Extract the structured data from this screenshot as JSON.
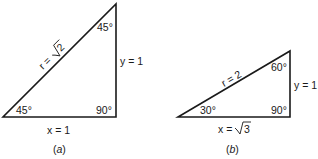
{
  "figures": [
    {
      "id": "a",
      "caption_open": "(",
      "caption_letter": "a",
      "caption_close": ")",
      "hypotenuse_label_prefix": "r = ",
      "hypotenuse_label_radicand": "2",
      "hypotenuse_value": "r = √2",
      "vertical_label": "y = 1",
      "horizontal_label": "x = 1",
      "angle_bottom_left": "45°",
      "angle_top": "45°",
      "angle_right": "90°"
    },
    {
      "id": "b",
      "caption_open": "(",
      "caption_letter": "b",
      "caption_close": ")",
      "hypotenuse_label": "r = 2",
      "vertical_label": "y = 1",
      "horizontal_label_prefix": "x = ",
      "horizontal_label_radicand": "3",
      "horizontal_value": "x = √3",
      "angle_bottom_left": "30°",
      "angle_top": "60°",
      "angle_right": "90°"
    }
  ]
}
